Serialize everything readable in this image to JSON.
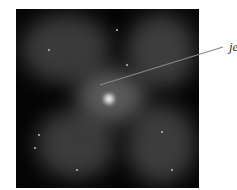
{
  "image": {
    "description": "X-ray astronomical image of galaxy with lobes and central jet",
    "label": "jet",
    "colors": {
      "background": "#050505",
      "glow": "#5a5a5a",
      "core": "#e8e8e8",
      "line": "#888888"
    }
  }
}
